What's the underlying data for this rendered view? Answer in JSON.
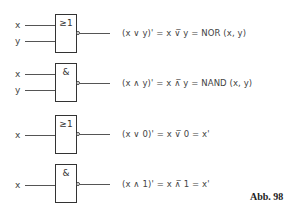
{
  "figure_label": "Abb. 98",
  "gates": [
    {
      "type": "NOR",
      "symbol": "≥1",
      "inputs": [
        "x",
        "y"
      ],
      "formula": "(x ∨ y)' = x ∨̅ y = NOR (x, y)"
    },
    {
      "type": "NAND",
      "symbol": "&",
      "inputs": [
        "x",
        "y"
      ],
      "formula": "(x ∧ y)' = x ∧̅ y = NAND (x, y)"
    },
    {
      "type": "NOR",
      "symbol": "≥1",
      "inputs": [
        "x"
      ],
      "formula": "(x ∨ 0)' = x ∨̅ 0 = x'"
    },
    {
      "type": "NAND",
      "symbol": "&",
      "inputs": [
        "x"
      ],
      "formula": "(x ∧ 1)' = x ∧̅ 1 = x'"
    }
  ]
}
